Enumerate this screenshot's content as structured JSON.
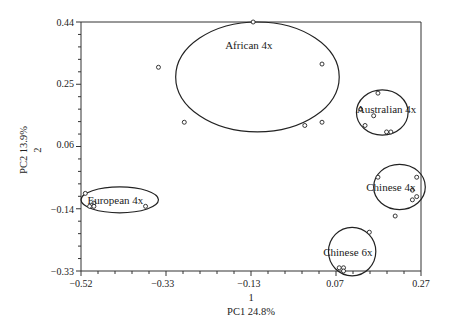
{
  "chart_data": {
    "type": "scatter",
    "title": "",
    "xlabel_line1": "1",
    "xlabel_line2": "PC1 24.8%",
    "ylabel_line1": "PC2 13.9%",
    "ylabel_line2": "2",
    "xlim": [
      -0.52,
      0.27
    ],
    "ylim": [
      -0.33,
      0.44
    ],
    "x_ticks": [
      "-0.52",
      "-0.33",
      "-0.13",
      "0.07",
      "0.27"
    ],
    "x_tick_values": [
      -0.52,
      -0.33,
      -0.13,
      0.07,
      0.27
    ],
    "y_ticks": [
      "0.44",
      "0.25",
      "0.06",
      "-0.14",
      "-0.33"
    ],
    "y_tick_values": [
      0.44,
      0.25,
      0.06,
      -0.14,
      -0.33
    ],
    "grid": false,
    "legend": "none",
    "series": [
      {
        "name": "African 4x",
        "points": [
          [
            -0.12,
            0.44
          ],
          [
            -0.34,
            0.3
          ],
          [
            0.04,
            0.31
          ],
          [
            -0.28,
            0.13
          ],
          [
            0.0,
            0.12
          ],
          [
            0.04,
            0.13
          ]
        ],
        "ellipse": {
          "cx": -0.11,
          "cy": 0.27,
          "rx": 0.19,
          "ry": 0.17
        },
        "label_pos": [
          -0.13,
          0.37
        ]
      },
      {
        "name": "Australian 4x",
        "points": [
          [
            0.17,
            0.22
          ],
          [
            0.13,
            0.17
          ],
          [
            0.16,
            0.15
          ],
          [
            0.14,
            0.12
          ],
          [
            0.19,
            0.1
          ],
          [
            0.2,
            0.1
          ]
        ],
        "ellipse": {
          "cx": 0.18,
          "cy": 0.16,
          "rx": 0.06,
          "ry": 0.07
        },
        "label_pos": [
          0.19,
          0.17
        ]
      },
      {
        "name": "European 4x",
        "points": [
          [
            -0.51,
            -0.09
          ],
          [
            -0.5,
            -0.13
          ],
          [
            -0.49,
            -0.12
          ],
          [
            -0.49,
            -0.13
          ],
          [
            -0.37,
            -0.13
          ]
        ],
        "ellipse": {
          "cx": -0.43,
          "cy": -0.11,
          "rx": 0.09,
          "ry": 0.04
        },
        "label_pos": [
          -0.44,
          -0.11
        ]
      },
      {
        "name": "Chinese 4x",
        "points": [
          [
            0.17,
            -0.04
          ],
          [
            0.26,
            -0.04
          ],
          [
            0.25,
            -0.08
          ],
          [
            0.26,
            -0.1
          ],
          [
            0.25,
            -0.11
          ],
          [
            0.21,
            -0.16
          ]
        ],
        "ellipse": {
          "cx": 0.22,
          "cy": -0.07,
          "rx": 0.06,
          "ry": 0.07
        },
        "label_pos": [
          0.2,
          -0.07
        ]
      },
      {
        "name": "Chinese 6x",
        "points": [
          [
            0.15,
            -0.21
          ],
          [
            0.08,
            -0.32
          ],
          [
            0.09,
            -0.32
          ],
          [
            0.09,
            -0.33
          ]
        ],
        "ellipse": {
          "cx": 0.11,
          "cy": -0.27,
          "rx": 0.055,
          "ry": 0.075
        },
        "label_pos": [
          0.1,
          -0.27
        ]
      }
    ]
  },
  "colors": {
    "line": "#222222",
    "background": "#ffffff"
  }
}
